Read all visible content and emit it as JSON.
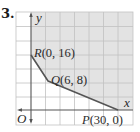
{
  "problem_number": "3.",
  "axes": {
    "x_label": "x",
    "y_label": "y",
    "origin_label": "O"
  },
  "points": [
    {
      "name": "R",
      "coords": "(0, 16)",
      "x": 0,
      "y": 16
    },
    {
      "name": "Q",
      "coords": "(6, 8)",
      "x": 6,
      "y": 8
    },
    {
      "name": "P",
      "coords": "(30, 0)",
      "x": 30,
      "y": 0
    }
  ],
  "colors": {
    "region_fill": "#e3e3e3",
    "grid_line": "#bdbdbd",
    "axis": "#555555",
    "boundary": "#555555"
  }
}
